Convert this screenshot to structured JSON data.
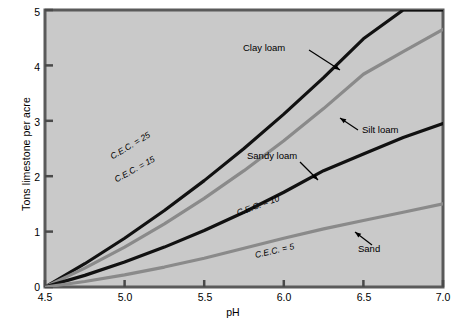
{
  "chart_data": {
    "type": "line",
    "title": "",
    "xlabel": "pH",
    "ylabel": "Tons limestone per acre",
    "xlim": [
      4.5,
      7.0
    ],
    "ylim": [
      0,
      5
    ],
    "xticks": [
      "4.5",
      "5.0",
      "5.5",
      "6.0",
      "6.5",
      "7.0"
    ],
    "yticks": [
      "0",
      "1",
      "2",
      "3",
      "4",
      "5"
    ],
    "grid": false,
    "legend": "inline-annotations",
    "x": [
      4.5,
      4.75,
      5.0,
      5.25,
      5.5,
      5.75,
      6.0,
      6.25,
      6.5,
      6.75,
      7.0
    ],
    "series": [
      {
        "name": "C.E.C. = 25",
        "soil": "Clay loam",
        "color": "#111111",
        "values": [
          0,
          0.42,
          0.88,
          1.38,
          1.92,
          2.5,
          3.12,
          3.78,
          4.48,
          5.0,
          5.0
        ],
        "cec": 25
      },
      {
        "name": "C.E.C. = 15",
        "soil": "Silt loam",
        "color": "#8a8a8a",
        "values": [
          0,
          0.34,
          0.72,
          1.14,
          1.6,
          2.1,
          2.64,
          3.22,
          3.84,
          4.25,
          4.65
        ],
        "cec": 15
      },
      {
        "name": "C.E.C. = 10",
        "soil": "Sandy loam",
        "color": "#111111",
        "values": [
          0,
          0.21,
          0.45,
          0.72,
          1.02,
          1.35,
          1.71,
          2.1,
          2.4,
          2.7,
          2.95
        ],
        "cec": 10
      },
      {
        "name": "C.E.C. = 5",
        "soil": "Sand",
        "color": "#8a8a8a",
        "values": [
          0,
          0.1,
          0.22,
          0.36,
          0.52,
          0.7,
          0.88,
          1.05,
          1.2,
          1.35,
          1.5
        ],
        "cec": 5
      }
    ],
    "annotations": [
      {
        "label": "Clay loam",
        "target_series": "C.E.C. = 25"
      },
      {
        "label": "Silt loam",
        "target_series": "C.E.C. = 15"
      },
      {
        "label": "Sandy loam",
        "target_series": "C.E.C. = 10"
      },
      {
        "label": "Sand",
        "target_series": "C.E.C. = 5"
      }
    ],
    "curve_labels": [
      "C.E.C. = 25",
      "C.E.C. = 15",
      "C.E.C. = 10",
      "C.E.C. = 5"
    ],
    "plot_background": "#c9c9c9",
    "frame_color": "#5a5a5a"
  }
}
